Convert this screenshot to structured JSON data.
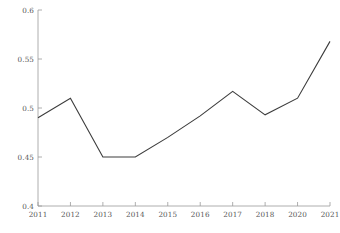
{
  "chart_data": {
    "type": "line",
    "title": "",
    "subtitle": "",
    "xlabel": "",
    "ylabel": "",
    "categories": [
      "2011",
      "2012",
      "2013",
      "2014",
      "2015",
      "2016",
      "2017",
      "2018",
      "2020",
      "2021"
    ],
    "values": [
      0.49,
      0.51,
      0.45,
      0.45,
      0.47,
      0.492,
      0.517,
      0.493,
      0.51,
      0.568
    ],
    "series": [
      {
        "name": "series-1",
        "values": [
          0.49,
          0.51,
          0.45,
          0.45,
          0.47,
          0.492,
          0.517,
          0.493,
          0.51,
          0.568
        ]
      }
    ],
    "xtick_labels": [
      "2011",
      "2012",
      "2013",
      "2014",
      "2015",
      "2016",
      "2017",
      "2018",
      "2020",
      "2021"
    ],
    "ytick_labels": [
      "0.4",
      "0.45",
      "0.5",
      "0.55",
      "0.6"
    ],
    "ytick_values": [
      0.4,
      0.45,
      0.5,
      0.55,
      0.6
    ],
    "ylim": [
      0.4,
      0.6
    ],
    "grid": false,
    "legend": false,
    "legend_position": "none",
    "line_color": "#3c3c3c",
    "axis_color": "#9a9a9a",
    "text_color": "#555555",
    "background_color": "#ffffff",
    "annotations": []
  }
}
